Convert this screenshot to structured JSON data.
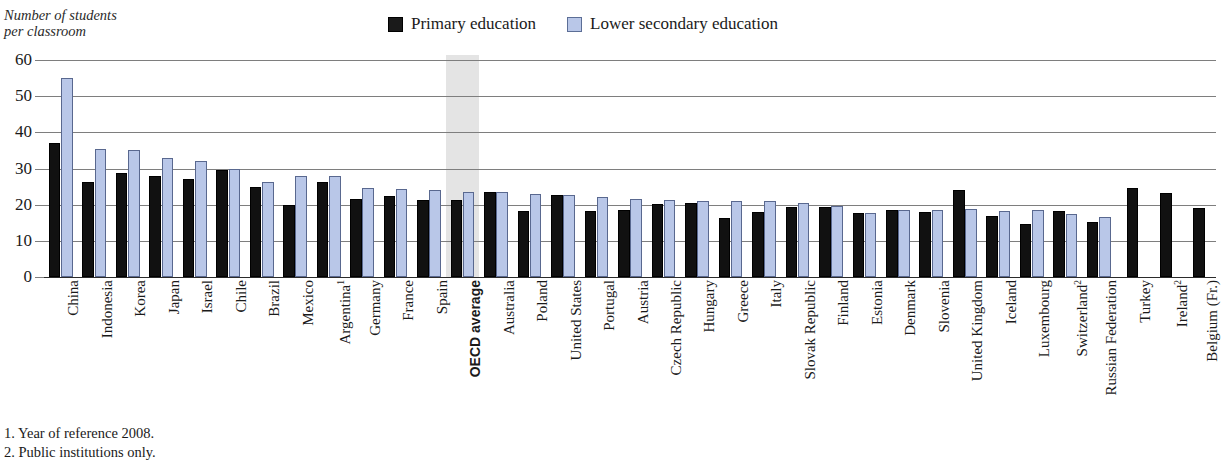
{
  "axis_title": "Number of students\nper classroom",
  "legend": {
    "position": "top-center",
    "items": [
      {
        "label": "Primary education",
        "color": "#111111",
        "swatch": "primary-swatch"
      },
      {
        "label": "Lower secondary education",
        "color": "#b9c7e8",
        "swatch": "lower-secondary-swatch"
      }
    ]
  },
  "footnotes": [
    "1. Year of reference 2008.",
    "2. Public institutions only."
  ],
  "highlight": {
    "category": "OECD average",
    "color": "#e2e2e2"
  },
  "chart_data": {
    "type": "bar",
    "title": "",
    "subtitle": "",
    "xlabel": "",
    "ylabel": "Number of students per classroom",
    "ylim": [
      0,
      60
    ],
    "yticks": [
      0,
      10,
      20,
      30,
      40,
      50,
      60
    ],
    "grid": true,
    "legend_position": "top-center",
    "categories": [
      "China",
      "Indonesia",
      "Korea",
      "Japan",
      "Israel",
      "Chile",
      "Brazil",
      "Mexico",
      "Argentina¹",
      "Germany",
      "France",
      "Spain",
      "OECD average",
      "Australia",
      "Poland",
      "United States",
      "Portugal",
      "Austria",
      "Czech Republic",
      "Hungary",
      "Greece",
      "Italy",
      "Slovak Republic",
      "Finland",
      "Estonia",
      "Denmark",
      "Slovenia",
      "United Kingdom",
      "Iceland",
      "Luxembourg",
      "Switzerland²",
      "Russian Federation",
      "Turkey",
      "Ireland²",
      "Belgium (Fr.)"
    ],
    "series": [
      {
        "name": "Primary education",
        "color": "#111111",
        "values": [
          37,
          26.3,
          28.8,
          28,
          27.2,
          29.6,
          24.8,
          19.8,
          26.2,
          21.5,
          22.5,
          21.2,
          21.2,
          23.5,
          18.2,
          22.8,
          18.2,
          18.4,
          20.2,
          20.6,
          16.2,
          18.1,
          19.4,
          19.4,
          17.6,
          18.5,
          18.1,
          24,
          17,
          14.6,
          18.2,
          15.2,
          24.6,
          23.2,
          19
        ]
      },
      {
        "name": "Lower secondary education",
        "color": "#b9c7e8",
        "values": [
          55,
          35.4,
          35.1,
          33,
          32.2,
          29.8,
          26.3,
          28,
          28,
          24.5,
          24.2,
          24.1,
          23.5,
          23.4,
          23,
          22.7,
          22,
          21.5,
          21.4,
          21,
          21,
          21,
          20.5,
          19.6,
          17.6,
          18.4,
          18.6,
          18.8,
          18.3,
          18.4,
          17.4,
          16.6,
          null,
          null,
          null
        ]
      }
    ]
  }
}
